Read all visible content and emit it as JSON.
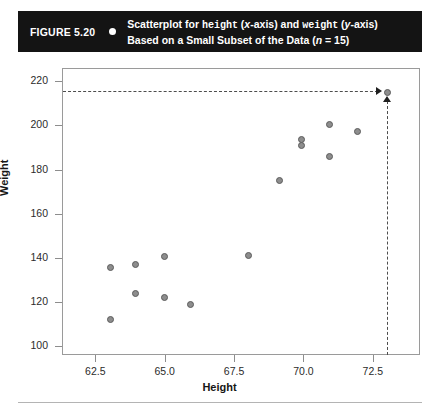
{
  "figure": {
    "number": "FIGURE 5.20",
    "bullet_icon": "bullet-dot-icon",
    "caption_line1_a": "Scatterplot for ",
    "caption_line1_var1": "height",
    "caption_line1_b": " (",
    "caption_line1_i1": "x",
    "caption_line1_c": "-axis) and ",
    "caption_line1_var2": "weight",
    "caption_line1_d": " (",
    "caption_line1_i2": "y",
    "caption_line1_e": "-axis)",
    "caption_line2_a": "Based on a Small Subset of the Data (",
    "caption_line2_i": "n",
    "caption_line2_b": " = 15)"
  },
  "chart_data": {
    "type": "scatter",
    "title": "Scatterplot for height (x-axis) and weight (y-axis) Based on a Small Subset of the Data (n = 15)",
    "xlabel": "Height",
    "ylabel": "Weight",
    "xlim": [
      61.3,
      74.2
    ],
    "ylim": [
      96,
      226
    ],
    "xticks": [
      "62.5",
      "65.0",
      "67.5",
      "70.0",
      "72.5"
    ],
    "xtick_values": [
      62.5,
      65.0,
      67.5,
      70.0,
      72.5
    ],
    "yticks": [
      "100",
      "120",
      "140",
      "160",
      "180",
      "200",
      "220"
    ],
    "ytick_values": [
      100,
      120,
      140,
      160,
      180,
      200,
      220
    ],
    "grid": false,
    "legend": false,
    "n": 15,
    "points": [
      {
        "x": 63.0,
        "y": 112.4
      },
      {
        "x": 63.0,
        "y": 136.0
      },
      {
        "x": 63.9,
        "y": 124.3
      },
      {
        "x": 63.9,
        "y": 137.5
      },
      {
        "x": 64.95,
        "y": 122.4
      },
      {
        "x": 64.95,
        "y": 141.0
      },
      {
        "x": 65.9,
        "y": 119.5
      },
      {
        "x": 68.0,
        "y": 141.4
      },
      {
        "x": 69.1,
        "y": 175.5
      },
      {
        "x": 69.9,
        "y": 191.5
      },
      {
        "x": 69.9,
        "y": 194.0
      },
      {
        "x": 70.9,
        "y": 186.5
      },
      {
        "x": 70.9,
        "y": 201.0
      },
      {
        "x": 71.9,
        "y": 197.5
      },
      {
        "x": 73.0,
        "y": 215.5
      }
    ],
    "annotations": [
      {
        "name": "highlighted-point",
        "x": 73.0,
        "y": 215.5,
        "guide_horizontal": true,
        "guide_vertical": true,
        "arrow_right_icon": "arrow-right-icon",
        "arrow_up_icon": "arrow-up-icon"
      }
    ]
  }
}
